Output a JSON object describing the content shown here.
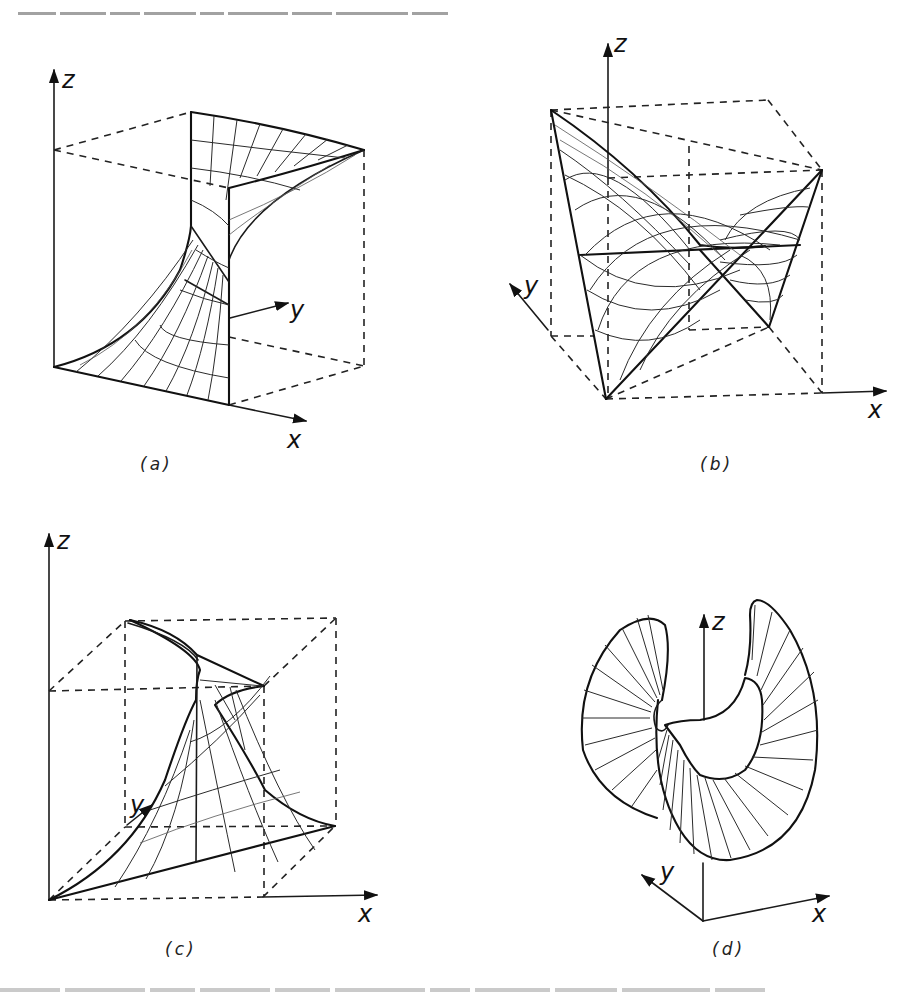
{
  "figure": {
    "panels": [
      {
        "id": "a",
        "label": "(a)",
        "axes": {
          "x": "x",
          "y": "y",
          "z": "z"
        },
        "description": "Hyperbolic surface patch in a box, ruled grid, dashed bounding box"
      },
      {
        "id": "b",
        "label": "(b)",
        "axes": {
          "x": "x",
          "y": "y",
          "z": "z"
        },
        "description": "Saddle (hyperbolic paraboloid) surface with curved grid inside dashed cube"
      },
      {
        "id": "c",
        "label": "(c)",
        "axes": {
          "x": "x",
          "y": "y",
          "z": "z"
        },
        "description": "Twisted swept surface with grid lines inside dashed cube"
      },
      {
        "id": "d",
        "label": "(d)",
        "axes": {
          "x": "x",
          "y": "y",
          "z": "z"
        },
        "description": "Closed ruled ring-like surface with radial generators"
      }
    ],
    "style": {
      "line_color": "#1a1a1a",
      "background": "#ffffff"
    }
  }
}
